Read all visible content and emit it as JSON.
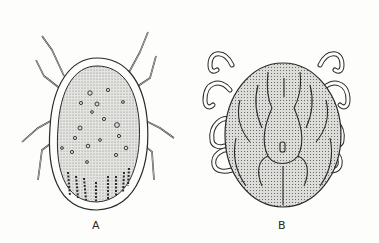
{
  "figure": {
    "panels": [
      {
        "id": "A",
        "label": "A",
        "subject": "tick, dorsal view with marginal rim and pitted scutum",
        "label_pos": [
          92,
          219
        ]
      },
      {
        "id": "B",
        "label": "B",
        "subject": "tick, dorsal view with festoon-like grooves",
        "label_pos": [
          278,
          219
        ]
      }
    ]
  },
  "colors": {
    "ink": "#2a2a2a",
    "stipple": "#d9d9d6",
    "paper": "#fdfdfc"
  }
}
